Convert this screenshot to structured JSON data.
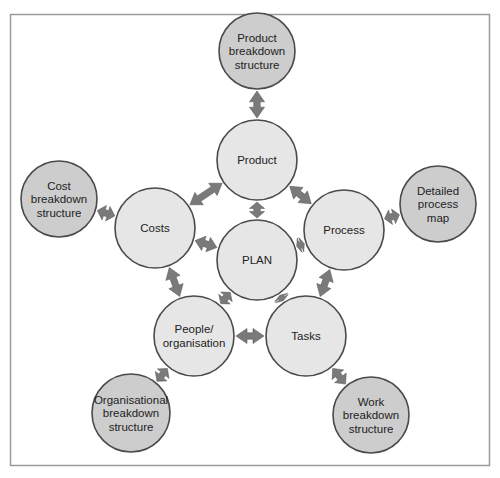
{
  "diagram": {
    "title": "",
    "colors": {
      "inner_fill": "#e6e6e6",
      "outer_fill": "#cdcdcd",
      "stroke": "#4a4a4a",
      "arrow": "#7a7a7a",
      "frame": "#9a9a9a"
    },
    "nodes": [
      {
        "id": "plan",
        "lines": [
          "PLAN"
        ],
        "x": 257,
        "y": 260,
        "r": 40,
        "ring": "center"
      },
      {
        "id": "product",
        "lines": [
          "Product"
        ],
        "x": 257,
        "y": 160,
        "r": 40,
        "ring": "inner"
      },
      {
        "id": "costs",
        "lines": [
          "Costs"
        ],
        "x": 155,
        "y": 228,
        "r": 40,
        "ring": "inner"
      },
      {
        "id": "process",
        "lines": [
          "Process"
        ],
        "x": 344,
        "y": 230,
        "r": 40,
        "ring": "inner"
      },
      {
        "id": "people",
        "lines": [
          "People/",
          "organisation"
        ],
        "x": 194,
        "y": 336,
        "r": 40,
        "ring": "inner"
      },
      {
        "id": "tasks",
        "lines": [
          "Tasks"
        ],
        "x": 306,
        "y": 336,
        "r": 40,
        "ring": "inner"
      },
      {
        "id": "pbs",
        "lines": [
          "Product",
          "breakdown",
          "structure"
        ],
        "x": 257,
        "y": 51,
        "r": 38,
        "ring": "outer"
      },
      {
        "id": "cbs",
        "lines": [
          "Cost",
          "breakdown",
          "structure"
        ],
        "x": 59,
        "y": 199,
        "r": 38,
        "ring": "outer"
      },
      {
        "id": "dpm",
        "lines": [
          "Detailed",
          "process",
          "map"
        ],
        "x": 438,
        "y": 204,
        "r": 38,
        "ring": "outer"
      },
      {
        "id": "obs",
        "lines": [
          "Organisational",
          "breakdown",
          "structure"
        ],
        "x": 131,
        "y": 413,
        "r": 39,
        "ring": "outer"
      },
      {
        "id": "wbs",
        "lines": [
          "Work",
          "breakdown",
          "structure"
        ],
        "x": 371,
        "y": 415,
        "r": 38,
        "ring": "outer"
      }
    ],
    "edges": [
      {
        "from": "pbs",
        "to": "product"
      },
      {
        "from": "product",
        "to": "plan"
      },
      {
        "from": "product",
        "to": "costs"
      },
      {
        "from": "product",
        "to": "process"
      },
      {
        "from": "cbs",
        "to": "costs"
      },
      {
        "from": "costs",
        "to": "plan"
      },
      {
        "from": "costs",
        "to": "people"
      },
      {
        "from": "process",
        "to": "plan"
      },
      {
        "from": "process",
        "to": "dpm"
      },
      {
        "from": "process",
        "to": "tasks"
      },
      {
        "from": "plan",
        "to": "people"
      },
      {
        "from": "plan",
        "to": "tasks"
      },
      {
        "from": "people",
        "to": "tasks"
      },
      {
        "from": "people",
        "to": "obs"
      },
      {
        "from": "tasks",
        "to": "wbs"
      }
    ]
  }
}
